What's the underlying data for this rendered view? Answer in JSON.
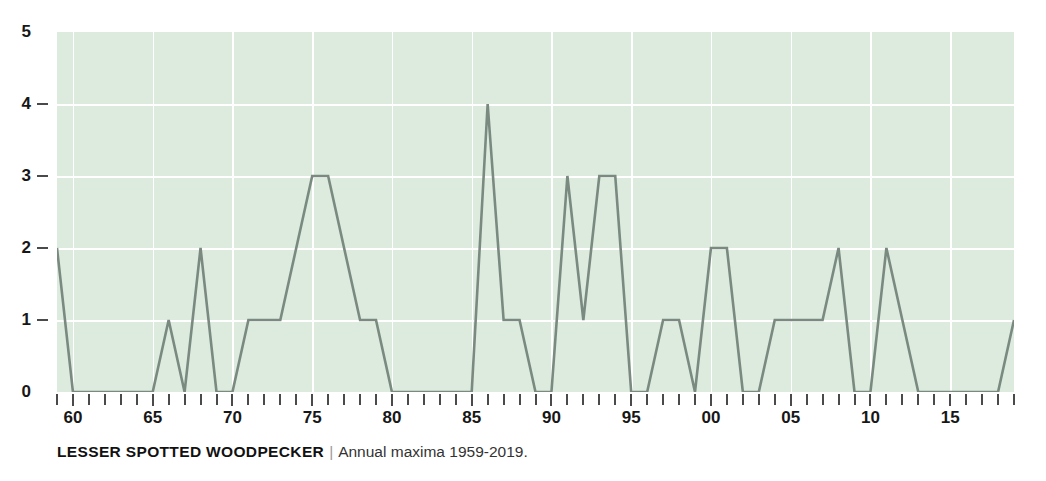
{
  "figure": {
    "cropped_title_fragment": "",
    "caption": {
      "species": "LESSER SPOTTED WOODPECKER",
      "separator": "|",
      "subtitle": "Annual maxima 1959-2019."
    }
  },
  "style": {
    "plot_background": "#dcebdd",
    "gridline_color": "#ffffff",
    "line_color": "#7a8a80",
    "tick_color": "#4a4a4a",
    "text_color": "#171717"
  },
  "chart_data": {
    "type": "line",
    "title": "LESSER SPOTTED WOODPECKER",
    "subtitle": "Annual maxima 1959-2019.",
    "xlabel": "",
    "ylabel": "",
    "xlim": [
      1959,
      2019
    ],
    "ylim": [
      0,
      5
    ],
    "grid": true,
    "legend": null,
    "y_ticks": [
      0,
      1,
      2,
      3,
      4,
      5
    ],
    "y_tick_labels": [
      "0",
      "1",
      "2",
      "3",
      "4",
      "5"
    ],
    "x_tick_years": [
      1960,
      1965,
      1970,
      1975,
      1980,
      1985,
      1990,
      1995,
      2000,
      2005,
      2010,
      2015
    ],
    "x_tick_labels": [
      "60",
      "65",
      "70",
      "75",
      "80",
      "85",
      "90",
      "95",
      "00",
      "05",
      "10",
      "15"
    ],
    "x_minor_every": 1,
    "x": [
      1959,
      1960,
      1961,
      1962,
      1963,
      1964,
      1965,
      1966,
      1967,
      1968,
      1969,
      1970,
      1971,
      1972,
      1973,
      1974,
      1975,
      1976,
      1977,
      1978,
      1979,
      1980,
      1981,
      1982,
      1983,
      1984,
      1985,
      1986,
      1987,
      1988,
      1989,
      1990,
      1991,
      1992,
      1993,
      1994,
      1995,
      1996,
      1997,
      1998,
      1999,
      2000,
      2001,
      2002,
      2003,
      2004,
      2005,
      2006,
      2007,
      2008,
      2009,
      2010,
      2011,
      2012,
      2013,
      2014,
      2015,
      2016,
      2017,
      2018,
      2019
    ],
    "values": [
      2,
      0,
      0,
      0,
      0,
      0,
      0,
      1,
      0,
      2,
      0,
      0,
      1,
      1,
      1,
      2,
      3,
      3,
      2,
      1,
      1,
      0,
      0,
      0,
      0,
      0,
      0,
      4,
      1,
      1,
      0,
      0,
      3,
      1,
      3,
      3,
      0,
      0,
      1,
      1,
      0,
      2,
      2,
      0,
      0,
      1,
      1,
      1,
      1,
      2,
      0,
      0,
      2,
      1,
      0,
      0,
      0,
      0,
      0,
      0,
      1
    ],
    "series_name": "Annual maxima"
  }
}
